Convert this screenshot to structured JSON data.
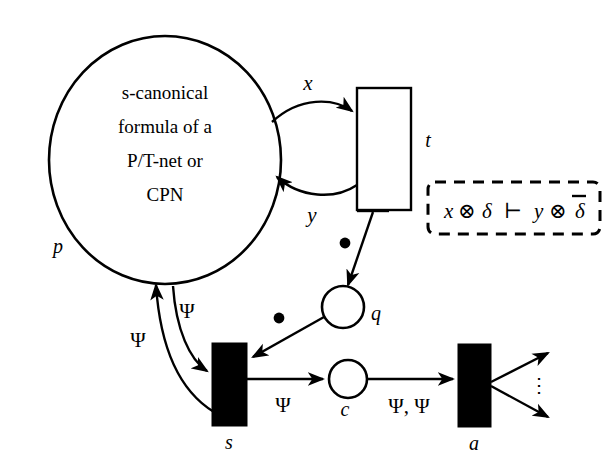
{
  "diagram": {
    "background_color": "#ffffff",
    "ink_color": "#000000"
  },
  "places": [
    {
      "id": "p",
      "label": "p",
      "shape": "large-circle",
      "text_lines": [
        "s-canonical",
        "formula of a",
        "P/T-net or",
        "CPN"
      ]
    },
    {
      "id": "q",
      "label": "q",
      "shape": "small-circle",
      "text_lines": []
    },
    {
      "id": "c",
      "label": "c",
      "shape": "small-circle",
      "text_lines": []
    }
  ],
  "transitions": [
    {
      "id": "t",
      "label": "t",
      "style": "open-rectangle"
    },
    {
      "id": "s",
      "label": "s",
      "style": "filled-rectangle"
    },
    {
      "id": "a",
      "label": "a",
      "style": "filled-rectangle"
    }
  ],
  "arcs": [
    {
      "id": "p-to-t",
      "from": "p",
      "to": "t",
      "label": "x"
    },
    {
      "id": "t-to-p",
      "from": "t",
      "to": "p",
      "label": "y"
    },
    {
      "id": "t-to-q",
      "from": "t",
      "to": "q",
      "label": "•"
    },
    {
      "id": "q-to-s",
      "from": "q",
      "to": "s",
      "label": "•"
    },
    {
      "id": "p-to-s",
      "from": "p",
      "to": "s",
      "label": "Ψ"
    },
    {
      "id": "s-to-p",
      "from": "s",
      "to": "p",
      "label": "Ψ"
    },
    {
      "id": "s-to-c",
      "from": "s",
      "to": "c",
      "label": "Ψ"
    },
    {
      "id": "c-to-a",
      "from": "c",
      "to": "a",
      "label": "Ψ, Ψ"
    },
    {
      "id": "a-out-upper",
      "from": "a",
      "to": "",
      "label": ""
    },
    {
      "id": "a-out-lower",
      "from": "a",
      "to": "",
      "label": ""
    }
  ],
  "annotation": {
    "id": "transition-formula",
    "border_style": "dashed",
    "parts": {
      "lhs_var": "x",
      "tensor_1": "⊗",
      "delta_1": "δ",
      "turnstile": "⊢",
      "rhs_var": "y",
      "tensor_2": "⊗",
      "delta_2": "δ",
      "delta_2_overline": true
    },
    "full_text": "x ⊗ δ ⊢ y ⊗ δ̅"
  },
  "decorations": {
    "vertical_ellipsis": "⋮"
  },
  "labels": {
    "p": "p",
    "q": "q",
    "c": "c",
    "t": "t",
    "s": "s",
    "a": "a",
    "x": "x",
    "y": "y",
    "psi": "Ψ",
    "psi_pair": "Ψ, Ψ",
    "bullet": "•",
    "line1": "s-canonical",
    "line2": "formula of a",
    "line3": "P/T-net or",
    "line4": "CPN"
  }
}
